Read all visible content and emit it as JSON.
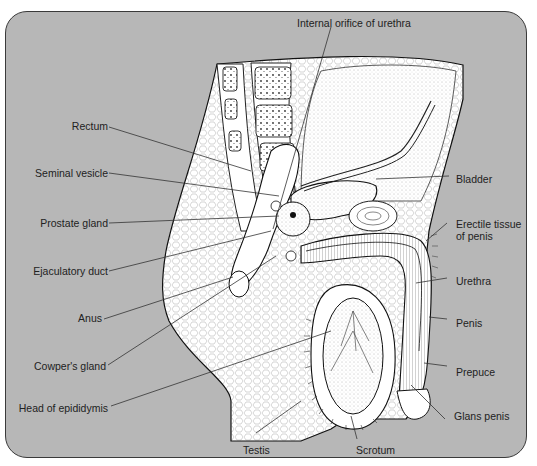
{
  "figure": {
    "panel_color": "#b7b7b7",
    "labels": {
      "internal_orifice": "Internal orifice of urethra",
      "rectum": "Rectum",
      "seminal_vesicle": "Seminal vesicle",
      "prostate_gland": "Prostate gland",
      "ejaculatory_duct": "Ejaculatory duct",
      "anus": "Anus",
      "cowpers_gland": "Cowper's gland",
      "head_of_epididymis": "Head of epididymis",
      "bladder": "Bladder",
      "erectile_tissue_1": "Erectile tissue",
      "erectile_tissue_2": "of penis",
      "urethra": "Urethra",
      "penis": "Penis",
      "prepuce": "Prepuce",
      "glans_penis": "Glans penis",
      "testis": "Testis",
      "scrotum": "Scrotum"
    }
  }
}
